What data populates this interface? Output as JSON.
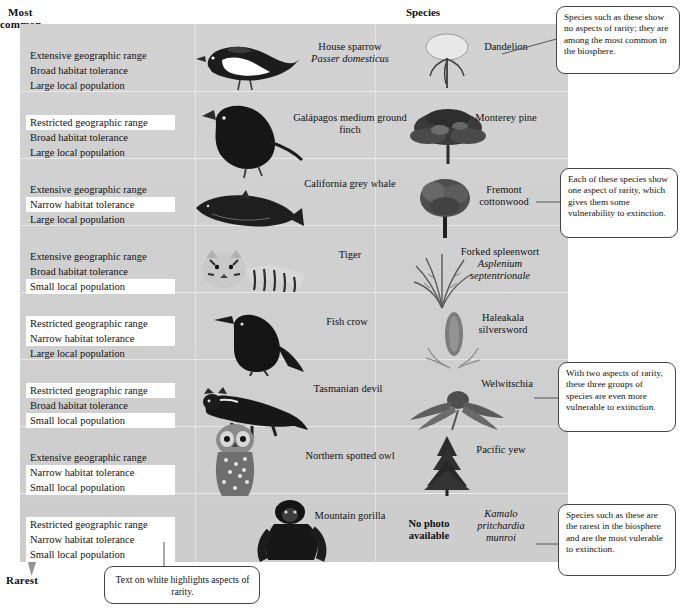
{
  "axis": {
    "top_label_line1": "Most",
    "top_label_line2": "common",
    "bottom_label": "Rarest",
    "arrow_name": "rarity-gradient-arrow"
  },
  "header": {
    "species_column": "Species"
  },
  "criteria_text": {
    "range_extensive": "Extensive geographic range",
    "range_restricted": "Restricted geographic range",
    "habitat_broad": "Broad habitat tolerance",
    "habitat_narrow": "Narrow habitat tolerance",
    "population_large": "Large local population",
    "population_small": "Small local population"
  },
  "rows": [
    {
      "index": 1,
      "criteria": [
        {
          "text": "Extensive geographic range",
          "highlighted": false
        },
        {
          "text": "Broad habitat tolerance",
          "highlighted": false
        },
        {
          "text": "Large local population",
          "highlighted": false
        }
      ],
      "species_left": {
        "common": "House sparrow",
        "scientific": "Passer domesticus",
        "art": "house-sparrow-illustration"
      },
      "species_right": {
        "common": "Dandelion",
        "scientific": "",
        "art": "dandelion-illustration"
      }
    },
    {
      "index": 2,
      "criteria": [
        {
          "text": "Restricted geographic range",
          "highlighted": true
        },
        {
          "text": "Broad habitat tolerance",
          "highlighted": false
        },
        {
          "text": "Large local population",
          "highlighted": false
        }
      ],
      "species_left": {
        "common": "Galápagos medium ground finch",
        "scientific": "",
        "art": "ground-finch-illustration"
      },
      "species_right": {
        "common": "Monterey pine",
        "scientific": "",
        "art": "monterey-pine-illustration"
      }
    },
    {
      "index": 3,
      "criteria": [
        {
          "text": "Extensive geographic range",
          "highlighted": false
        },
        {
          "text": "Narrow habitat tolerance",
          "highlighted": true
        },
        {
          "text": "Large local population",
          "highlighted": false
        }
      ],
      "species_left": {
        "common": "California grey whale",
        "scientific": "",
        "art": "grey-whale-illustration"
      },
      "species_right": {
        "common": "Fremont cottonwood",
        "scientific": "",
        "art": "fremont-cottonwood-illustration"
      }
    },
    {
      "index": 4,
      "criteria": [
        {
          "text": "Extensive geographic range",
          "highlighted": false
        },
        {
          "text": "Broad habitat tolerance",
          "highlighted": false
        },
        {
          "text": "Small local population",
          "highlighted": true
        }
      ],
      "species_left": {
        "common": "Tiger",
        "scientific": "",
        "art": "tiger-illustration"
      },
      "species_right": {
        "common": "Forked spleenwort",
        "scientific": "Asplenium septentrionale",
        "art": "forked-spleenwort-illustration"
      }
    },
    {
      "index": 5,
      "criteria": [
        {
          "text": "Restricted geographic range",
          "highlighted": true
        },
        {
          "text": "Narrow habitat tolerance",
          "highlighted": true
        },
        {
          "text": "Large local population",
          "highlighted": false
        }
      ],
      "species_left": {
        "common": "Fish crow",
        "scientific": "",
        "art": "fish-crow-illustration"
      },
      "species_right": {
        "common": "Haleakala silversword",
        "scientific": "",
        "art": "haleakala-silversword-illustration"
      }
    },
    {
      "index": 6,
      "criteria": [
        {
          "text": "Restricted geographic range",
          "highlighted": true
        },
        {
          "text": "Broad habitat tolerance",
          "highlighted": false
        },
        {
          "text": "Small local population",
          "highlighted": true
        }
      ],
      "species_left": {
        "common": "Tasmanian devil",
        "scientific": "",
        "art": "tasmanian-devil-illustration"
      },
      "species_right": {
        "common": "Welwitschia",
        "scientific": "",
        "art": "welwitschia-illustration"
      }
    },
    {
      "index": 7,
      "criteria": [
        {
          "text": "Extensive geographic range",
          "highlighted": false
        },
        {
          "text": "Narrow habitat tolerance",
          "highlighted": true
        },
        {
          "text": "Small local population",
          "highlighted": true
        }
      ],
      "species_left": {
        "common": "Northern spotted owl",
        "scientific": "",
        "art": "spotted-owl-illustration"
      },
      "species_right": {
        "common": "Pacific yew",
        "scientific": "",
        "art": "pacific-yew-illustration"
      }
    },
    {
      "index": 8,
      "criteria": [
        {
          "text": "Restricted geographic range",
          "highlighted": true
        },
        {
          "text": "Narrow habitat tolerance",
          "highlighted": true
        },
        {
          "text": "Small local population",
          "highlighted": true
        }
      ],
      "species_left": {
        "common": "Mountain gorilla",
        "scientific": "",
        "art": "mountain-gorilla-illustration"
      },
      "species_right": {
        "common": "",
        "no_photo": "No photo available",
        "scientific": "Kamalo pritchardia munroi",
        "art": "no-photo-placeholder"
      }
    }
  ],
  "callouts": [
    {
      "id": "callout-no-rarity",
      "text": "Species such as these show no aspects of rarity; they are among the most common in the biosphere."
    },
    {
      "id": "callout-one-aspect",
      "text": "Each of these species show one aspect of rarity, which gives them some vulnerability to extinction."
    },
    {
      "id": "callout-two-aspects",
      "text": "With two aspects of rarity, these three groups of species are even more vulnerable to extinction."
    },
    {
      "id": "callout-rarest",
      "text": "Species such as these are the rarest in the biosphere and are the most vulerable to extinction."
    },
    {
      "id": "callout-legend",
      "text": "Text on white highlights aspects of rarity."
    }
  ],
  "colors": {
    "panel_bg": "#d0d0d0",
    "highlight": "#ffffff",
    "arrow_dark": "#8f8f8f",
    "arrow_light": "#c8c8c8",
    "callout_border": "#444444",
    "text": "#111111"
  }
}
